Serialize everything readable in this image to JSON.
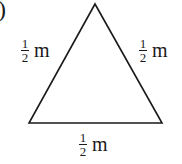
{
  "figure": {
    "part_marker": ")",
    "shape": "equilateral-triangle",
    "sides": [
      {
        "name": "left",
        "numerator": "1",
        "denominator": "2",
        "unit": "m"
      },
      {
        "name": "right",
        "numerator": "1",
        "denominator": "2",
        "unit": "m"
      },
      {
        "name": "bottom",
        "numerator": "1",
        "denominator": "2",
        "unit": "m"
      }
    ],
    "stroke_color": "#1a1a1a"
  }
}
